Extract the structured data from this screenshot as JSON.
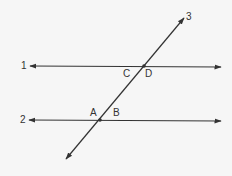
{
  "diagram": {
    "type": "parallel-lines-cut-by-transversal",
    "lines": [
      {
        "id": "1",
        "label": "1",
        "kind": "line",
        "description": "horizontal line with arrows at both ends (upper)"
      },
      {
        "id": "2",
        "label": "2",
        "kind": "line",
        "description": "horizontal line with arrows at both ends (lower)"
      },
      {
        "id": "3",
        "label": "3",
        "kind": "transversal",
        "description": "diagonal line crossing lines 1 and 2"
      }
    ],
    "angle_labels": {
      "c": "C",
      "d": "D",
      "a": "A",
      "b": "B"
    },
    "intersections": [
      {
        "lines": [
          "1",
          "3"
        ],
        "angles": [
          "C",
          "D"
        ]
      },
      {
        "lines": [
          "2",
          "3"
        ],
        "angles": [
          "A",
          "B"
        ]
      }
    ],
    "colors": {
      "stroke": "#333333",
      "background": "#f6f6f6",
      "text": "#333333"
    }
  }
}
